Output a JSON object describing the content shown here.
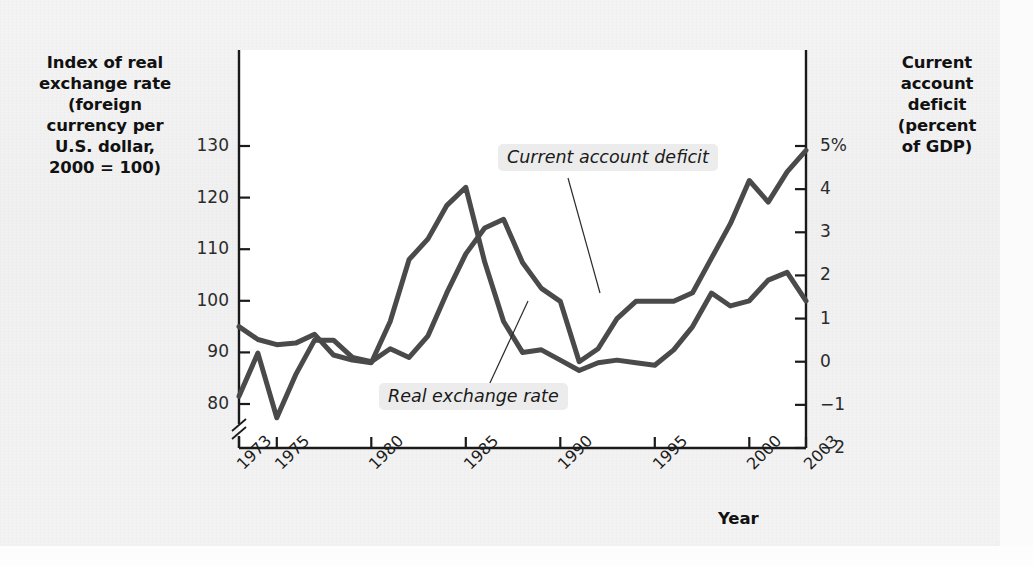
{
  "figure": {
    "background_color": "#f2f2f2",
    "plot_background_color": "#ffffff",
    "line_color": "#4a4a4a",
    "axis_color": "#1a1a1a"
  },
  "axes": {
    "left": {
      "title": "Index of real exchange rate (foreign currency per U.S. dollar, 2000 = 100)",
      "title_lines": [
        "Index of real",
        "exchange rate",
        "(foreign",
        "currency per",
        "U.S. dollar,",
        "2000 = 100)"
      ],
      "ticks": [
        "130",
        "120",
        "110",
        "100",
        "90",
        "80"
      ],
      "tick_values": [
        130,
        120,
        110,
        100,
        90,
        80
      ],
      "has_axis_break": true
    },
    "right": {
      "title": "Current account deficit (percent of GDP)",
      "title_lines": [
        "Current",
        "account",
        "deficit",
        "(percent",
        "of GDP)"
      ],
      "ticks": [
        "5%",
        "4",
        "3",
        "2",
        "1",
        "0",
        "-1",
        "-2"
      ],
      "tick_values": [
        5,
        4,
        3,
        2,
        1,
        0,
        -1,
        -2
      ]
    },
    "bottom": {
      "title": "Year",
      "ticks": [
        "1973",
        "1975",
        "1980",
        "1985",
        "1990",
        "1995",
        "2000",
        "2003"
      ],
      "tick_values": [
        1973,
        1975,
        1980,
        1985,
        1990,
        1995,
        2000,
        2003
      ]
    }
  },
  "annotations": [
    {
      "name": "current-account-deficit-label",
      "text": "Current account deficit"
    },
    {
      "name": "real-exchange-rate-label",
      "text": "Real exchange rate"
    }
  ],
  "chart_data": {
    "type": "line",
    "title": "",
    "xlabel": "Year",
    "grid": false,
    "legend": "inline-annotations",
    "x": [
      1973,
      1974,
      1975,
      1976,
      1977,
      1978,
      1979,
      1980,
      1981,
      1982,
      1983,
      1984,
      1985,
      1986,
      1987,
      1988,
      1989,
      1990,
      1991,
      1992,
      1993,
      1994,
      1995,
      1996,
      1997,
      1998,
      1999,
      2000,
      2001,
      2002,
      2003
    ],
    "series": [
      {
        "name": "Real exchange rate",
        "axis": "left",
        "ylabel": "Index of real exchange rate (foreign currency per U.S. dollar, 2000 = 100)",
        "ylim": [
          75,
          135
        ],
        "values": [
          95.0,
          92.5,
          91.5,
          91.8,
          93.5,
          89.5,
          88.5,
          88.0,
          96.0,
          108.0,
          112.0,
          118.5,
          122.0,
          107.5,
          96.0,
          90.0,
          90.5,
          88.5,
          86.5,
          88.0,
          88.5,
          88.0,
          87.5,
          90.5,
          95.0,
          101.5,
          99.0,
          100.0,
          104.0,
          105.5,
          100.0
        ]
      },
      {
        "name": "Current account deficit",
        "axis": "right",
        "ylabel": "Current account deficit (percent of GDP)",
        "ylim": [
          -2,
          5.6
        ],
        "values": [
          -0.8,
          0.2,
          -1.3,
          -0.3,
          0.5,
          0.5,
          0.1,
          0.0,
          0.3,
          0.1,
          0.6,
          1.6,
          2.5,
          3.1,
          3.3,
          2.3,
          1.7,
          1.4,
          0.0,
          0.3,
          1.0,
          1.4,
          1.4,
          1.4,
          1.6,
          2.4,
          3.2,
          4.2,
          3.7,
          4.4,
          4.9
        ]
      }
    ]
  }
}
